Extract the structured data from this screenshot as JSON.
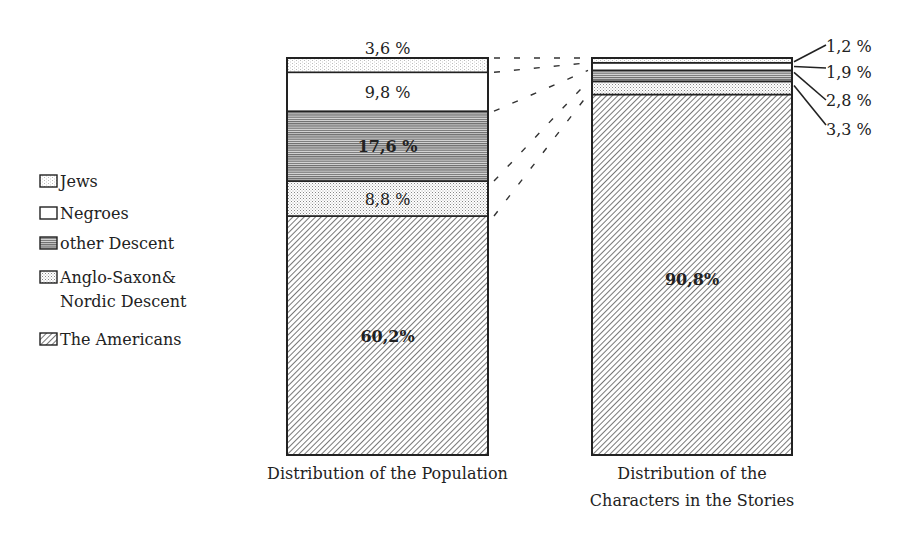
{
  "chart_data": {
    "type": "bar",
    "subtype": "stacked-100-percent",
    "categories": [
      "Distribution of the Population",
      "Distribution of the Characters in the Stories"
    ],
    "category_labels": [
      [
        "Distribution of the Population"
      ],
      [
        "Distribution of the",
        "Characters in the Stories"
      ]
    ],
    "series": [
      {
        "name": "The Americans",
        "pattern": "diagonal-hatch",
        "values": [
          60.2,
          90.8
        ],
        "labels": [
          "60,2%",
          "90,8%"
        ]
      },
      {
        "name": "Anglo-Saxon& Nordic Descent",
        "pattern": "dots",
        "values": [
          8.8,
          3.3
        ],
        "labels": [
          "8,8 %",
          "3,3 %"
        ]
      },
      {
        "name": "other Descent",
        "pattern": "horizontal-lines",
        "values": [
          17.6,
          2.8
        ],
        "labels": [
          "17,6 %",
          "2,8 %"
        ]
      },
      {
        "name": "Negroes",
        "pattern": "blank",
        "values": [
          9.8,
          1.9
        ],
        "labels": [
          "9,8 %",
          "1,9 %"
        ]
      },
      {
        "name": "Jews",
        "pattern": "light-dots",
        "values": [
          3.6,
          1.2
        ],
        "labels": [
          "3,6 %",
          "1,2 %"
        ]
      }
    ],
    "legend": {
      "position": "left",
      "entries": [
        {
          "label_lines": [
            "Jews"
          ],
          "pattern": "light-dots"
        },
        {
          "label_lines": [
            "Negroes"
          ],
          "pattern": "blank"
        },
        {
          "label_lines": [
            "other Descent"
          ],
          "pattern": "horizontal-lines"
        },
        {
          "label_lines": [
            "Anglo-Saxon&",
            "Nordic Descent"
          ],
          "pattern": "dots"
        },
        {
          "label_lines": [
            "The Americans"
          ],
          "pattern": "diagonal-hatch"
        }
      ]
    },
    "title": "",
    "xlabel": "",
    "ylabel": "",
    "ylim": [
      0,
      100
    ],
    "grid": false,
    "connectors": "dashed lines linking segment boundaries of the left bar to the right bar"
  }
}
